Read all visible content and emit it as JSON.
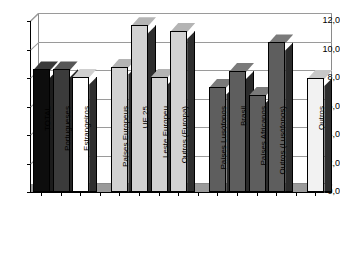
{
  "chart_data": {
    "type": "bar",
    "title": "",
    "subtitle": "",
    "xlabel": "",
    "ylabel": "",
    "ylim": [
      0.0,
      12.0
    ],
    "ytick_step": 2.0,
    "decimal_separator": ",",
    "grid": true,
    "legend": "none",
    "style": "3d-column",
    "ytick_labels": [
      "0,0",
      "2,0",
      "4,0",
      "6,0",
      "8,0",
      "10,0",
      "12,0"
    ],
    "ytick_values": [
      0.0,
      2.0,
      4.0,
      6.0,
      8.0,
      10.0,
      12.0
    ],
    "categories": [
      "TOTAL",
      "Portugueses",
      "Estrangeiros",
      "",
      "Países Europeus",
      "UE 25",
      "Leste Europeu",
      "Outros (Europa)",
      "",
      "Países Lusófonos",
      "Brasil",
      "Países Africanos",
      "Outros (Lusófonos)",
      "",
      "Outros"
    ],
    "values": [
      8.6,
      8.6,
      8.1,
      null,
      8.8,
      11.7,
      8.1,
      11.3,
      null,
      7.4,
      8.5,
      6.8,
      10.5,
      null,
      8.0
    ],
    "bar_fills": [
      "black",
      "darkgray",
      "white",
      "none",
      "lightgray",
      "lightgray",
      "lightgray",
      "lightgray",
      "none",
      "midgray",
      "midgray",
      "midgray",
      "midgray",
      "none",
      "offwhite"
    ]
  }
}
